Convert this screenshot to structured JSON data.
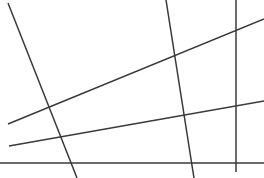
{
  "figure": {
    "name": "line-arrangement",
    "width": 264,
    "height": 178,
    "background_color": "#ffffff",
    "stroke_color": "#3a3a3a",
    "stroke_width": 1.5,
    "lines": [
      {
        "id": "descending-line",
        "label": "steep descending line",
        "x1": 8,
        "y1": 3,
        "x2": 77,
        "y2": 178
      },
      {
        "id": "upper-ascending-line",
        "label": "upper shallow ascending line",
        "x1": 8,
        "y1": 124,
        "x2": 264,
        "y2": 19
      },
      {
        "id": "lower-ascending-line",
        "label": "lower shallow ascending line",
        "x1": 9,
        "y1": 146,
        "x2": 264,
        "y2": 101
      },
      {
        "id": "tilted-vertical-line",
        "label": "slightly tilted vertical line",
        "x1": 166,
        "y1": 0,
        "x2": 194,
        "y2": 178
      },
      {
        "id": "vertical-line",
        "label": "vertical line",
        "x1": 236,
        "y1": 0,
        "x2": 236,
        "y2": 172
      },
      {
        "id": "horizontal-line",
        "label": "horizontal baseline",
        "x1": 0,
        "y1": 163,
        "x2": 264,
        "y2": 163
      }
    ]
  }
}
